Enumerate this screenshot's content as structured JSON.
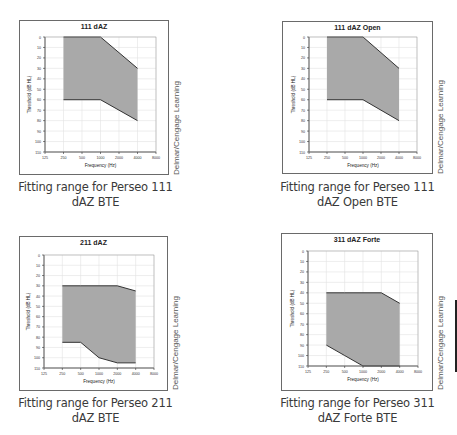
{
  "credit_text": "Delmar/Cengage Learning",
  "axis": {
    "xlabel": "Frequency (Hz)",
    "ylabel": "Threshold (dB HL)",
    "x_ticks": [
      "125",
      "250",
      "500",
      "1000",
      "2000",
      "4000",
      "8000"
    ],
    "y_ticks": [
      "0",
      "10",
      "20",
      "30",
      "40",
      "50",
      "60",
      "70",
      "80",
      "90",
      "100",
      "110"
    ]
  },
  "colors": {
    "fill": "#a9a9a9",
    "edge": "#333333",
    "grid": "#e2e2e2",
    "frame": "#6a6a6a"
  },
  "panels": [
    {
      "title": "111 dAZ",
      "caption_line1": "Fitting range for Perseo 111",
      "caption_line2": "dAZ BTE"
    },
    {
      "title": "111 dAZ Open",
      "caption_line1": "Fitting range for Perseo 111",
      "caption_line2": "dAZ Open BTE"
    },
    {
      "title": "211 dAZ",
      "caption_line1": "Fitting range for Perseo 211",
      "caption_line2": "dAZ BTE"
    },
    {
      "title": "311 dAZ Forte",
      "caption_line1": "Fitting range for Perseo 311",
      "caption_line2": "dAZ Forte BTE"
    }
  ],
  "chart_data": [
    {
      "type": "area",
      "title": "111 dAZ",
      "xlabel": "Frequency (Hz)",
      "ylabel": "Threshold (dB HL)",
      "categories": [
        "125",
        "250",
        "500",
        "1000",
        "2000",
        "4000",
        "8000"
      ],
      "ylim": [
        0,
        110
      ],
      "y_inverted": true,
      "grid": true,
      "series": [
        {
          "name": "upper limit",
          "x": [
            250,
            500,
            1000,
            2000,
            4000
          ],
          "values": [
            0,
            0,
            0,
            15,
            30
          ]
        },
        {
          "name": "lower limit",
          "x": [
            250,
            500,
            1000,
            2000,
            4000
          ],
          "values": [
            60,
            60,
            60,
            70,
            80
          ]
        }
      ]
    },
    {
      "type": "area",
      "title": "111 dAZ Open",
      "xlabel": "Frequency (Hz)",
      "ylabel": "Threshold (dB HL)",
      "categories": [
        "125",
        "250",
        "500",
        "1000",
        "2000",
        "4000",
        "8000"
      ],
      "ylim": [
        0,
        110
      ],
      "y_inverted": true,
      "grid": true,
      "series": [
        {
          "name": "upper limit",
          "x": [
            250,
            500,
            1000,
            2000,
            4000
          ],
          "values": [
            0,
            0,
            0,
            15,
            30
          ]
        },
        {
          "name": "lower limit",
          "x": [
            250,
            500,
            1000,
            2000,
            4000
          ],
          "values": [
            60,
            60,
            60,
            70,
            80
          ]
        }
      ]
    },
    {
      "type": "area",
      "title": "211 dAZ",
      "xlabel": "Frequency (Hz)",
      "ylabel": "Threshold (dB HL)",
      "categories": [
        "125",
        "250",
        "500",
        "1000",
        "2000",
        "4000",
        "8000"
      ],
      "ylim": [
        0,
        110
      ],
      "y_inverted": true,
      "grid": true,
      "series": [
        {
          "name": "upper limit",
          "x": [
            250,
            500,
            1000,
            2000,
            4000
          ],
          "values": [
            30,
            30,
            30,
            30,
            35
          ]
        },
        {
          "name": "lower limit",
          "x": [
            250,
            500,
            1000,
            2000,
            4000
          ],
          "values": [
            85,
            85,
            100,
            105,
            105
          ]
        }
      ]
    },
    {
      "type": "area",
      "title": "311 dAZ Forte",
      "xlabel": "Frequency (Hz)",
      "ylabel": "Threshold (dB HL)",
      "categories": [
        "125",
        "250",
        "500",
        "1000",
        "2000",
        "4000",
        "8000"
      ],
      "ylim": [
        0,
        110
      ],
      "y_inverted": true,
      "grid": true,
      "series": [
        {
          "name": "upper limit",
          "x": [
            250,
            500,
            1000,
            2000,
            4000
          ],
          "values": [
            40,
            40,
            40,
            40,
            50
          ]
        },
        {
          "name": "lower limit",
          "x": [
            250,
            500,
            1000,
            2000,
            4000
          ],
          "values": [
            90,
            100,
            110,
            110,
            110
          ]
        }
      ]
    }
  ]
}
